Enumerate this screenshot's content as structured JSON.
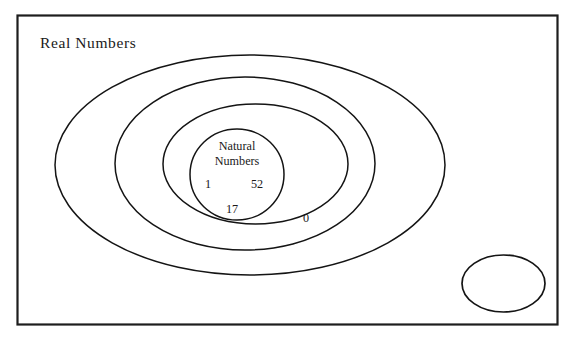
{
  "diagram": {
    "type": "euler-venn-nested-sets",
    "universe": {
      "label": "Real Numbers",
      "shape": "rectangle"
    },
    "sets": [
      {
        "name": "outer-set",
        "label": "",
        "shape": "ellipse"
      },
      {
        "name": "second-set",
        "label": "",
        "shape": "ellipse"
      },
      {
        "name": "third-set",
        "label": "",
        "shape": "ellipse"
      },
      {
        "name": "natural-numbers-set",
        "label_line1": "Natural",
        "label_line2": "Numbers",
        "shape": "ellipse"
      }
    ],
    "elements": [
      {
        "name": "element-one",
        "value": "1",
        "region": "natural-numbers-set"
      },
      {
        "name": "element-fiftytwo",
        "value": "52",
        "region": "natural-numbers-set"
      },
      {
        "name": "element-seventeen",
        "value": "17",
        "region": "natural-numbers-set"
      },
      {
        "name": "element-zero",
        "value": "0",
        "region": "third-set"
      }
    ],
    "unlabeled_region": {
      "name": "empty-ellipse",
      "label": "",
      "shape": "ellipse"
    },
    "colors": {
      "background": "#ffffff",
      "stroke": "#141414",
      "rectangle_stroke": "#1d1d1d",
      "text": "#1a1a1a"
    }
  }
}
